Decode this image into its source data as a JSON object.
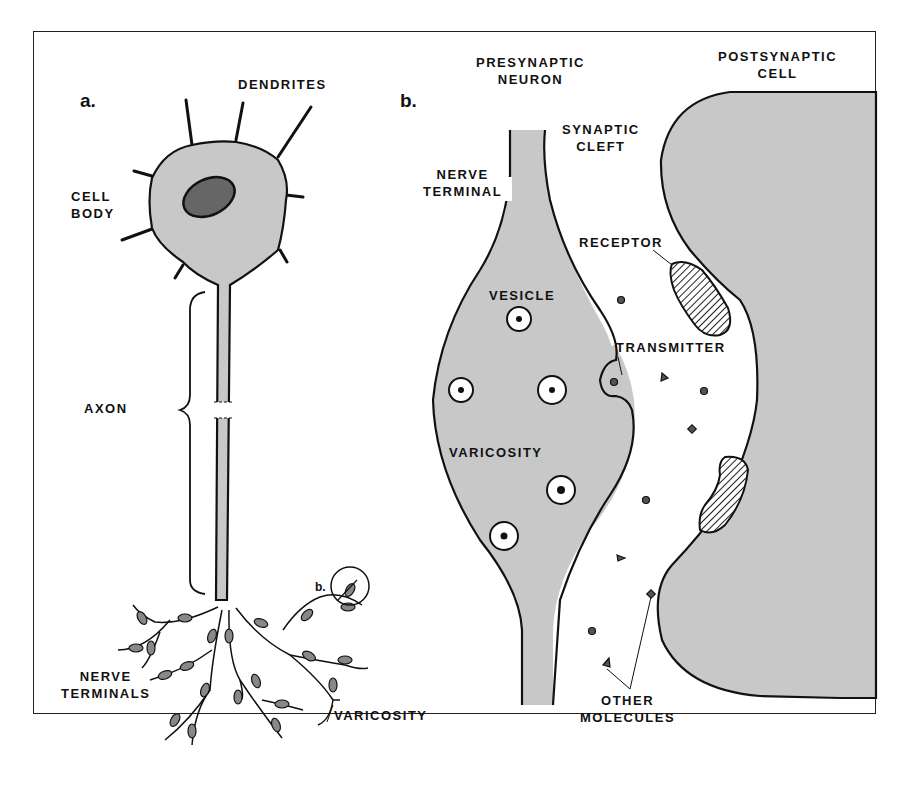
{
  "figure": {
    "panel_a": {
      "letter": "a.",
      "labels": {
        "dendrites": "DENDRITES",
        "cell_body": "CELL\nBODY",
        "axon": "AXON",
        "nerve_terminals": "NERVE\nTERMINALS",
        "varicosity": "VARICOSITY",
        "inset_marker": "b."
      }
    },
    "panel_b": {
      "letter": "b.",
      "labels": {
        "presynaptic_neuron": "PRESYNAPTIC\nNEURON",
        "postsynaptic_cell": "POSTSYNAPTIC\nCELL",
        "synaptic_cleft": "SYNAPTIC\nCLEFT",
        "nerve_terminal": "NERVE\nTERMINAL",
        "receptor": "RECEPTOR",
        "vesicle": "VESICLE",
        "transmitter": "TRANSMITTER",
        "varicosity": "VARICOSITY",
        "other_molecules": "OTHER\nMOLECULES"
      }
    },
    "colors": {
      "cell_fill": "#c8c8c8",
      "outline": "#111111",
      "nucleus": "#555555",
      "background": "#ffffff"
    }
  }
}
